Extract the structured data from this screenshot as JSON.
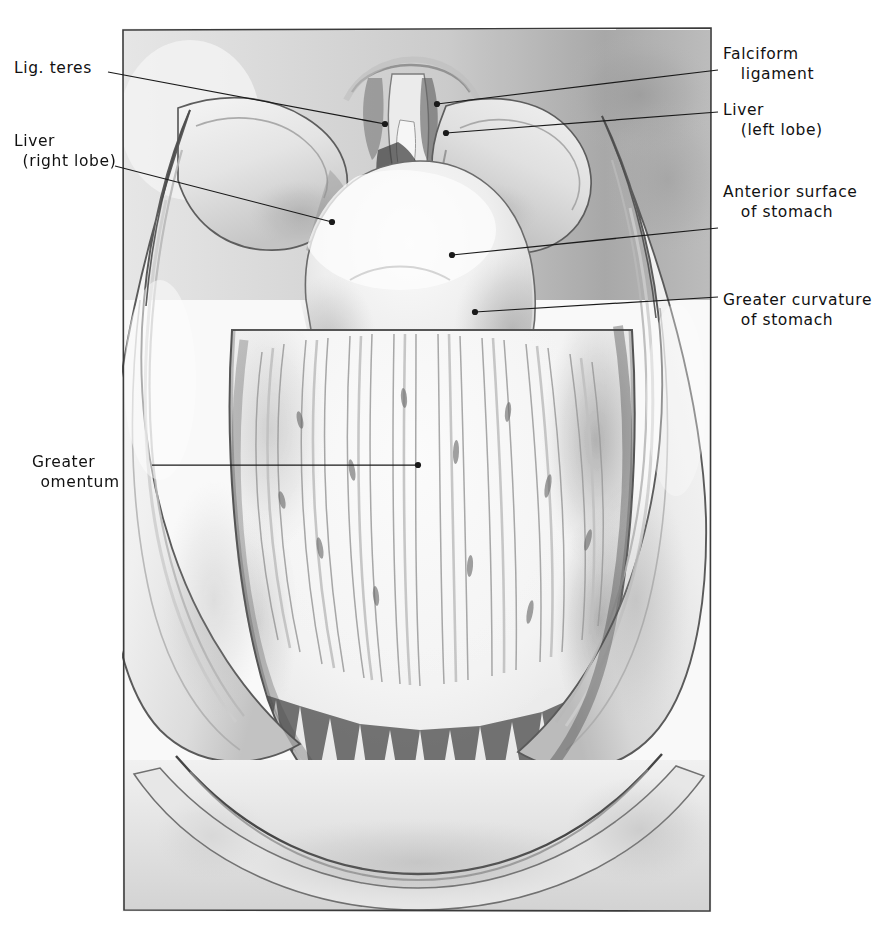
{
  "figure": {
    "kind": "anatomical-illustration",
    "medium": "pencil / wash drawing, grayscale",
    "frame": {
      "x": 122,
      "y": 28,
      "width": 590,
      "height": 884,
      "stroke": "#3a3a3a"
    },
    "background": "#ffffff",
    "ink": "#1a1a1a"
  },
  "labels": [
    {
      "id": "lig-teres",
      "text": "Lig. teres",
      "lines": [
        "Lig. teres"
      ],
      "side": "left",
      "text_x": 14,
      "text_y": 58,
      "leader": {
        "from_x": 108,
        "from_y": 72,
        "to_x": 385,
        "to_y": 124,
        "dot": true
      }
    },
    {
      "id": "liver-right-lobe",
      "text": "Liver (right lobe)",
      "lines": [
        "Liver",
        "(right lobe)"
      ],
      "side": "left",
      "text_x": 14,
      "text_y": 131,
      "leader": {
        "from_x": 115,
        "from_y": 166,
        "to_x": 332,
        "to_y": 222,
        "dot": true
      }
    },
    {
      "id": "greater-omentum",
      "text": "Greater omentum",
      "lines": [
        "Greater",
        "omentum"
      ],
      "side": "left",
      "text_x": 32,
      "text_y": 452,
      "leader": {
        "from_x": 152,
        "from_y": 465,
        "to_x": 418,
        "to_y": 465,
        "dot": true
      }
    },
    {
      "id": "falciform-ligament",
      "text": "Falciform ligament",
      "lines": [
        "Falciform",
        "ligament"
      ],
      "side": "right",
      "text_x": 723,
      "text_y": 44,
      "leader": {
        "from_x": 718,
        "from_y": 70,
        "to_x": 437,
        "to_y": 104,
        "dot": true
      }
    },
    {
      "id": "liver-left-lobe",
      "text": "Liver (left lobe)",
      "lines": [
        "Liver",
        "(left lobe)"
      ],
      "side": "right",
      "text_x": 723,
      "text_y": 100,
      "leader": {
        "from_x": 718,
        "from_y": 112,
        "to_x": 446,
        "to_y": 133,
        "dot": true
      }
    },
    {
      "id": "anterior-surface-of-stomach",
      "text": "Anterior surface of stomach",
      "lines": [
        "Anterior surface",
        "of stomach"
      ],
      "side": "right",
      "text_x": 723,
      "text_y": 182,
      "leader": {
        "from_x": 718,
        "from_y": 228,
        "to_x": 452,
        "to_y": 255,
        "dot": true
      }
    },
    {
      "id": "greater-curvature-of-stomach",
      "text": "Greater curvature of stomach",
      "lines": [
        "Greater curvature",
        "of stomach"
      ],
      "side": "right",
      "text_x": 723,
      "text_y": 290,
      "leader": {
        "from_x": 718,
        "from_y": 297,
        "to_x": 475,
        "to_y": 312,
        "dot": true
      }
    }
  ]
}
